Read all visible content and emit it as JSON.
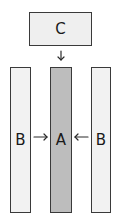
{
  "diagram": {
    "nodes": {
      "c": {
        "label": "C",
        "fill": "#efefef"
      },
      "b_left": {
        "label": "B",
        "fill": "#f2f2f2"
      },
      "a": {
        "label": "A",
        "fill": "#bdbdbd"
      },
      "b_right": {
        "label": "B",
        "fill": "#f2f2f2"
      }
    },
    "edges": [
      {
        "from": "C",
        "to": "A"
      },
      {
        "from": "B",
        "to": "A"
      },
      {
        "from": "B",
        "to": "A"
      }
    ]
  }
}
